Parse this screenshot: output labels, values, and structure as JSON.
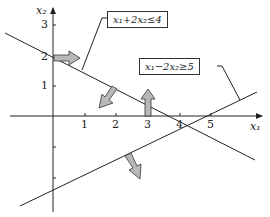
{
  "axes": {
    "x_label": "x₁",
    "y_label": "x₂",
    "x_ticks": [
      "1",
      "2",
      "3",
      "4",
      "5"
    ],
    "y_ticks": [
      "1",
      "2",
      "3"
    ]
  },
  "constraints": [
    {
      "label": "x₁+2x₂≤4",
      "line": "x1 + 2x2 = 4"
    },
    {
      "label": "x₁−2x₂≥5",
      "line": "x1 - 2x2 = 5"
    }
  ],
  "colors": {
    "line": "#222222",
    "arrow_fill": "#b8b8b8",
    "arrow_stroke": "#333333"
  }
}
